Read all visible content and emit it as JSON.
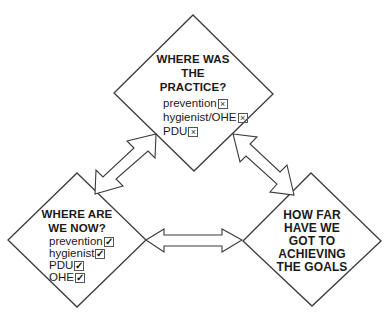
{
  "diagram": {
    "nodes": [
      {
        "id": "past",
        "title_lines": [
          "WHERE WAS",
          "THE",
          "PRACTICE?"
        ],
        "items": [
          {
            "label": "prevention",
            "mark": "×",
            "state": "absent"
          },
          {
            "label": "hygienist/OHE",
            "mark": "×",
            "state": "absent"
          },
          {
            "label": "PDU",
            "mark": "×",
            "state": "absent"
          }
        ]
      },
      {
        "id": "present",
        "title_lines": [
          "WHERE ARE",
          "WE NOW?"
        ],
        "items": [
          {
            "label": "prevention",
            "mark": "✓",
            "state": "present"
          },
          {
            "label": "hygienist",
            "mark": "✓",
            "state": "present"
          },
          {
            "label": "PDU",
            "mark": "✓",
            "state": "present"
          },
          {
            "label": "OHE",
            "mark": "✓",
            "state": "present"
          }
        ]
      },
      {
        "id": "progress",
        "title_lines": [
          "HOW FAR",
          "HAVE WE",
          "GOT TO",
          "ACHIEVING",
          "THE GOALS"
        ],
        "items": []
      }
    ],
    "edges": [
      {
        "from": "past",
        "to": "present",
        "type": "double-arrow"
      },
      {
        "from": "past",
        "to": "progress",
        "type": "double-arrow"
      },
      {
        "from": "present",
        "to": "progress",
        "type": "double-arrow"
      }
    ],
    "colors": {
      "stroke": "#3a3a3a",
      "fill": "#ffffff",
      "text": "#1a1a1a"
    }
  }
}
